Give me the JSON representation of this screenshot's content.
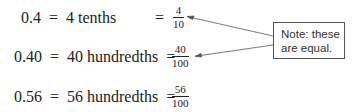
{
  "rows": [
    {
      "decimal": "0.4",
      "eq1": "=",
      "words": "4 tenths",
      "eq2": "=",
      "num": "4",
      "den": "10"
    },
    {
      "decimal": "0.40",
      "eq1": "=",
      "words": "40 hundredths",
      "eq2": "=",
      "num": "40",
      "den": "100"
    },
    {
      "decimal": "0.56",
      "eq1": "=",
      "words": "56 hundredths",
      "eq2": "=",
      "num": "56",
      "den": "100"
    }
  ],
  "note": {
    "line1": "Note: these",
    "line2": "are equal."
  }
}
